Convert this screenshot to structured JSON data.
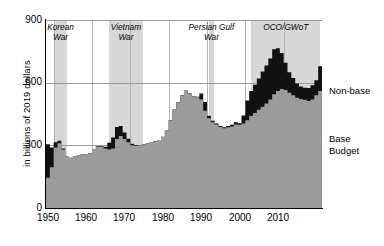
{
  "chart_data": {
    "type": "area",
    "title": "",
    "subtitle": "",
    "xlabel": "",
    "ylabel": "in billions of 2019 dollars",
    "xlim": [
      1948,
      2020
    ],
    "ylim": [
      0,
      900
    ],
    "yticks": [
      0,
      300,
      600,
      900
    ],
    "xticks": [
      1950,
      1960,
      1970,
      1980,
      1990,
      2000,
      2010
    ],
    "grid": "horizontal-and-decade-vertical",
    "legend_position": "right",
    "stacked": true,
    "colors": {
      "base": "#9b9b9b",
      "nonbase": "#111111",
      "band": "#d7d7d7",
      "gridline": "#9a9a9a",
      "axis": "#000000"
    },
    "series": [
      {
        "name": "Base Budget",
        "color": "#9b9b9b",
        "values": [
          145,
          195,
          290,
          310,
          280,
          245,
          240,
          245,
          250,
          255,
          258,
          262,
          282,
          295,
          292,
          285,
          280,
          285,
          330,
          345,
          330,
          315,
          300,
          298,
          300,
          305,
          308,
          312,
          318,
          325,
          340,
          370,
          420,
          470,
          505,
          540,
          562,
          548,
          535,
          530,
          520,
          465,
          430,
          410,
          398,
          388,
          382,
          386,
          390,
          400,
          398,
          405,
          420,
          440,
          455,
          470,
          485,
          500,
          520,
          545,
          560,
          570,
          565,
          552,
          540,
          528,
          522,
          518,
          512,
          520,
          540,
          560
        ]
      },
      {
        "name": "Non-base",
        "color": "#111111",
        "values": [
          160,
          95,
          25,
          12,
          5,
          2,
          1,
          1,
          1,
          1,
          1,
          1,
          1,
          2,
          4,
          8,
          32,
          52,
          58,
          48,
          32,
          16,
          8,
          4,
          2,
          1,
          1,
          1,
          1,
          1,
          1,
          1,
          1,
          1,
          1,
          1,
          1,
          1,
          1,
          2,
          28,
          42,
          12,
          8,
          6,
          5,
          5,
          6,
          8,
          10,
          8,
          38,
          95,
          120,
          135,
          150,
          168,
          182,
          196,
          215,
          205,
          172,
          130,
          98,
          82,
          68,
          60,
          58,
          62,
          68,
          72,
          118
        ]
      }
    ],
    "x_start_year": 1948,
    "war_bands": [
      {
        "label_line1": "Korean",
        "label_line2": "War",
        "start": 1950,
        "end": 1953.6
      },
      {
        "label_line1": "Vietnam",
        "label_line2": "War",
        "start": 1964.5,
        "end": 1973.2
      },
      {
        "label_line1": "Persian Gulf",
        "label_line2": "War",
        "start": 1990.5,
        "end": 1991.8
      },
      {
        "label_line1": "OCO/GWoT",
        "label_line2": "",
        "start": 2001.5,
        "end": 2019.6
      }
    ]
  },
  "legend": {
    "nonbase_label": "Non-base",
    "base_label_line1": "Base",
    "base_label_line2": "Budget"
  },
  "axes": {
    "y_title": "in billions of 2019 dollars",
    "y_tick_900": "900",
    "y_tick_600": "600",
    "y_tick_300": "300",
    "y_tick_0": "0",
    "x_tick_1950": "1950",
    "x_tick_1960": "1960",
    "x_tick_1970": "1970",
    "x_tick_1980": "1980",
    "x_tick_1990": "1990",
    "x_tick_2000": "2000",
    "x_tick_2010": "2010"
  },
  "bands": {
    "korean_line1": "Korean",
    "korean_line2": "War",
    "vietnam_line1": "Vietnam",
    "vietnam_line2": "War",
    "gulf_line1": "Persian Gulf",
    "gulf_line2": "War",
    "oco_line1": "OCO/GWoT"
  }
}
